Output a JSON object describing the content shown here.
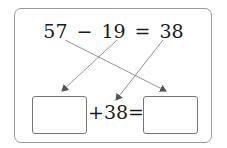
{
  "equation_top": {
    "minuend": "57",
    "minus": "−",
    "subtrahend": "19",
    "equals": "=",
    "difference": "38"
  },
  "equation_bottom": {
    "left_blank": "",
    "plus": "+",
    "addend": "38",
    "equals": "=",
    "right_blank": ""
  },
  "arrows": [
    {
      "from": "57",
      "to": "right-blank"
    },
    {
      "from": "19",
      "to": "left-blank"
    },
    {
      "from": "38",
      "to": "addend-38"
    }
  ]
}
